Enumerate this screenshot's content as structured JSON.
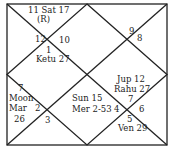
{
  "chart_title": "",
  "chart_type": "North Indian birth chart",
  "colors": {
    "line": "#222222",
    "text": "#222222",
    "background": "#ffffff"
  },
  "houses": [
    {
      "sign": "1",
      "planets": "Ketu 27"
    },
    {
      "sign": "2",
      "planets": ""
    },
    {
      "sign": "3",
      "planets": ""
    },
    {
      "sign": "4",
      "planets": "Sun 15 Mer 2-53"
    },
    {
      "sign": "5",
      "planets": "Ven 29"
    },
    {
      "sign": "6",
      "planets": ""
    },
    {
      "sign": "7",
      "planets": "Jup 12 Rahu 27"
    },
    {
      "sign": "8",
      "planets": ""
    },
    {
      "sign": "9",
      "planets": ""
    },
    {
      "sign": "10",
      "planets": ""
    },
    {
      "sign": "11",
      "planets": "Sat 17 (R)"
    },
    {
      "sign": "12",
      "planets": ""
    },
    {
      "sign": "7",
      "planets": "Moon Mar 26"
    }
  ],
  "labels": {
    "top_a": "11 Sat 17",
    "top_b": "(R)",
    "s12": "12",
    "s10": "10",
    "s1": "1",
    "ketu": "Ketu 27",
    "s9": "9",
    "s8": "8",
    "jup": "Jup 12",
    "rahu": "Rahu 27",
    "s7r": "7",
    "s6": "6",
    "s4": "4",
    "sun": "Sun 15",
    "mer": "Mer 2-53",
    "s5": "5",
    "ven": "Ven 29",
    "s7l": "7",
    "moon": "Moon",
    "mar": "Mar",
    "mar26": "26",
    "s2": "2",
    "s3": "3"
  }
}
